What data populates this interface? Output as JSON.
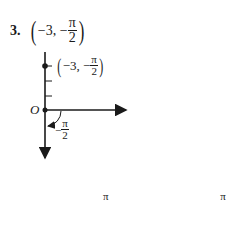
{
  "problem": {
    "number": "3.",
    "point_open": "(",
    "point_r": "−3, −",
    "point_theta_num": "π",
    "point_theta_den": "2",
    "point_close": ")"
  },
  "diagram": {
    "point_label_r": "−3, −",
    "point_label_num": "π",
    "point_label_den": "2",
    "origin_label": "O",
    "angle_label_sign": "−",
    "angle_label_num": "π",
    "angle_label_den": "2"
  },
  "equations": {
    "x_lhs": "x",
    "x_eq": " = −3 cos",
    "x_arg_sign": "−",
    "x_arg_num": "π",
    "x_arg_den": "2",
    "x_result": " = 0;",
    "y_lhs": "y",
    "y_eq": " = −3 sin",
    "y_arg_sign": "−",
    "y_arg_num": "π",
    "y_arg_den": "2",
    "y_result": " = 3"
  }
}
